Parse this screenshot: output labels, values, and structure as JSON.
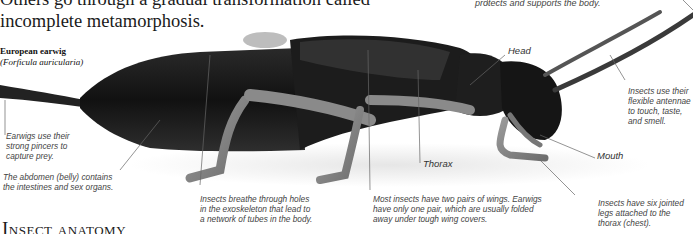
{
  "intro": {
    "line1": "Others go through a gradual transformation called",
    "line2": "incomplete metamorphosis."
  },
  "specimen": {
    "common_name": "European earwig",
    "latin_name": "(Forficula auricularia)"
  },
  "section_title": "Insect anatomy",
  "top_cutoff_note": "protects and supports the body.",
  "labels": {
    "head": "Head",
    "thorax": "Thorax",
    "mouth": "Mouth"
  },
  "notes": {
    "pincers": [
      "Earwigs use their",
      "strong pincers to",
      "capture prey."
    ],
    "abdomen": [
      "The abdomen (belly) contains",
      "the intestines and sex organs."
    ],
    "breathing": [
      "Insects breathe through holes",
      "in the exoskeleton that lead to",
      "a network of tubes in the body."
    ],
    "wings": [
      "Most insects have two pairs of wings. Earwigs",
      "have only one pair, which are usually folded",
      "away under tough wing covers."
    ],
    "antennae": [
      "Insects use their",
      "flexible antennae",
      "to touch, taste,",
      "and smell."
    ],
    "legs": [
      "Insects have six jointed",
      "legs attached to the",
      "thorax (chest)."
    ]
  }
}
